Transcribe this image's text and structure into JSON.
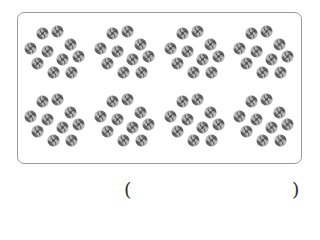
{
  "figure": {
    "rows": 2,
    "groups_per_row": 4,
    "candies_per_group": 10,
    "candy_icon": "pinwheel-candy-icon",
    "colors": {
      "candy_dark": "#4a4a4a",
      "candy_light": "#b8b8b8",
      "border": "#9a9a9a"
    }
  },
  "answer": {
    "open_paren": "(",
    "close_paren": ")",
    "value": ""
  }
}
